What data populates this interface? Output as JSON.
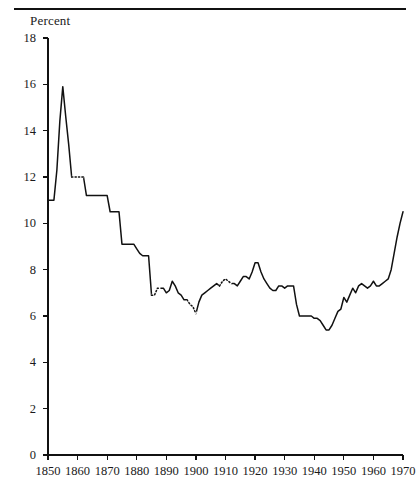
{
  "figure": {
    "axis_label": "Percent",
    "has_top_rule": true,
    "line_color": "#111111",
    "text_color": "#1a1a1a"
  },
  "chart_data": {
    "type": "line",
    "title": "",
    "subtitle": "",
    "xlabel": "",
    "ylabel": "Percent",
    "grid": false,
    "legend": null,
    "xlim": [
      1850,
      1970
    ],
    "ylim": [
      0,
      18
    ],
    "xticks": [
      1850,
      1860,
      1870,
      1880,
      1890,
      1900,
      1910,
      1920,
      1930,
      1940,
      1950,
      1960,
      1970
    ],
    "yticks": [
      0,
      2,
      4,
      6,
      8,
      10,
      12,
      14,
      16,
      18
    ],
    "xtick_labels": [
      "1850",
      "1860",
      "1870",
      "1880",
      "1890",
      "1900",
      "1910",
      "1920",
      "1930",
      "1940",
      "1950",
      "1960",
      "1970"
    ],
    "ytick_labels": [
      "0",
      "2",
      "4",
      "6",
      "8",
      "10",
      "12",
      "14",
      "16",
      "18"
    ],
    "series": [
      {
        "name": "Percent",
        "x": [
          1850,
          1851,
          1852,
          1853,
          1854,
          1855,
          1856,
          1857,
          1858,
          1859,
          1860,
          1861,
          1862,
          1863,
          1864,
          1865,
          1866,
          1867,
          1868,
          1869,
          1870,
          1871,
          1872,
          1873,
          1874,
          1875,
          1876,
          1877,
          1878,
          1879,
          1880,
          1881,
          1882,
          1883,
          1884,
          1885,
          1886,
          1887,
          1888,
          1889,
          1890,
          1891,
          1892,
          1893,
          1894,
          1895,
          1896,
          1897,
          1898,
          1899,
          1900,
          1901,
          1902,
          1903,
          1904,
          1905,
          1906,
          1907,
          1908,
          1909,
          1910,
          1911,
          1912,
          1913,
          1914,
          1915,
          1916,
          1917,
          1918,
          1919,
          1920,
          1921,
          1922,
          1923,
          1924,
          1925,
          1926,
          1927,
          1928,
          1929,
          1930,
          1931,
          1932,
          1933,
          1934,
          1935,
          1936,
          1937,
          1938,
          1939,
          1940,
          1941,
          1942,
          1943,
          1944,
          1945,
          1946,
          1947,
          1948,
          1949,
          1950,
          1951,
          1952,
          1953,
          1954,
          1955,
          1956,
          1957,
          1958,
          1959,
          1960,
          1961,
          1962,
          1963,
          1964,
          1965,
          1966,
          1967,
          1968,
          1969,
          1970
        ],
        "y": [
          11.0,
          11.0,
          11.0,
          12.3,
          14.4,
          15.9,
          14.6,
          13.4,
          12.0,
          12.0,
          12.0,
          12.0,
          12.0,
          11.2,
          11.2,
          11.2,
          11.2,
          11.2,
          11.2,
          11.2,
          11.2,
          10.5,
          10.5,
          10.5,
          10.5,
          9.1,
          9.1,
          9.1,
          9.1,
          9.1,
          8.9,
          8.7,
          8.6,
          8.6,
          8.6,
          6.9,
          6.9,
          7.2,
          7.2,
          7.2,
          7.0,
          7.1,
          7.5,
          7.3,
          7.0,
          6.9,
          6.7,
          6.7,
          6.5,
          6.4,
          6.1,
          6.6,
          6.9,
          7.0,
          7.1,
          7.2,
          7.3,
          7.4,
          7.3,
          7.5,
          7.6,
          7.5,
          7.4,
          7.4,
          7.3,
          7.5,
          7.7,
          7.7,
          7.6,
          7.9,
          8.3,
          8.3,
          7.9,
          7.6,
          7.4,
          7.2,
          7.1,
          7.1,
          7.3,
          7.3,
          7.2,
          7.3,
          7.3,
          7.3,
          6.5,
          6.0,
          6.0,
          6.0,
          6.0,
          6.0,
          5.9,
          5.9,
          5.8,
          5.6,
          5.4,
          5.4,
          5.6,
          5.9,
          6.2,
          6.3,
          6.8,
          6.6,
          6.9,
          7.2,
          7.0,
          7.3,
          7.4,
          7.3,
          7.2,
          7.3,
          7.5,
          7.3,
          7.3,
          7.4,
          7.5,
          7.6,
          8.0,
          8.7,
          9.4,
          10.0,
          10.5
        ]
      }
    ],
    "dotted_segments": [
      {
        "x_start": 1858,
        "x_end": 1862,
        "note": "estimated"
      },
      {
        "x_start": 1885,
        "x_end": 1888,
        "note": "estimated"
      },
      {
        "x_start": 1897,
        "x_end": 1900,
        "note": "estimated"
      },
      {
        "x_start": 1908,
        "x_end": 1912,
        "note": "estimated"
      }
    ],
    "min_value": 5.4,
    "max_value": 15.9
  }
}
